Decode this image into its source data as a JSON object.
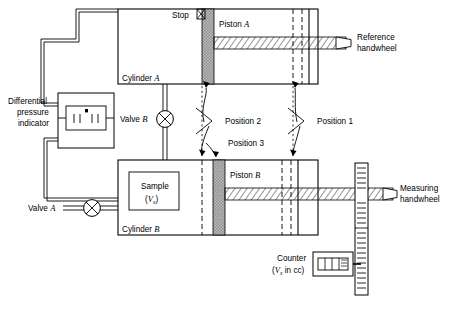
{
  "figure": {
    "type": "schematic-diagram",
    "background_color": "#ffffff",
    "line_color": "#000000",
    "piston_fill": "#b9b9b9",
    "rod_hatch_color": "#555555"
  },
  "labels": {
    "differential_pressure_indicator": [
      "Differential",
      "pressure",
      "indicator"
    ],
    "valve_a": "Valve A",
    "valve_b": "Valve B",
    "cylinder_a": "Cylinder A",
    "cylinder_b": "Cylinder B",
    "stop": "Stop",
    "piston_a": "Piston A",
    "piston_b": "Piston B",
    "sample": "Sample",
    "sample_volume": "(V",
    "sample_volume_sub": "x",
    "sample_volume_close": ")",
    "reference_handwheel": [
      "Reference",
      "handwheel"
    ],
    "measuring_handwheel": [
      "Measuring",
      "handwheel"
    ],
    "counter": "Counter",
    "counter_units_open": "(V",
    "counter_units_sub": "x",
    "counter_units_close": " in cc)",
    "position_1": "Position 1",
    "position_2": "Position 2",
    "position_3": "Position 3"
  },
  "italic_parts": {
    "a": "A",
    "b": "B"
  },
  "components": {
    "cylinder_a": {
      "x": 118,
      "y": 9,
      "w": 200,
      "h": 75
    },
    "cylinder_b": {
      "x": 118,
      "y": 160,
      "w": 200,
      "h": 75
    },
    "piston_a": {
      "x": 202,
      "y": 9,
      "w": 12,
      "h": 75
    },
    "piston_b": {
      "x": 213,
      "y": 160,
      "w": 12,
      "h": 75
    },
    "dpi_box": {
      "x": 58,
      "y": 93,
      "w": 56,
      "h": 55
    },
    "sample_box": {
      "x": 129,
      "y": 172,
      "w": 50,
      "h": 38
    },
    "counter_box": {
      "x": 313,
      "y": 252,
      "w": 40,
      "h": 24
    },
    "measuring_scale": {
      "x": 355,
      "y": 163,
      "w": 13,
      "h": 132
    },
    "valve_a": {
      "cx": 92,
      "cy": 208,
      "r": 8
    },
    "valve_b": {
      "cx": 165,
      "cy": 119,
      "r": 8
    }
  },
  "position_markers": {
    "position_1_x": 293,
    "position_2_x": 202,
    "position_3_x": 213
  },
  "scale_ticks": 26,
  "counter_digits": 4
}
